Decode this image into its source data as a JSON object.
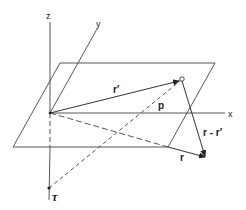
{
  "diagram": {
    "axes": {
      "z": "z",
      "y": "y",
      "x": "x"
    },
    "vectors": {
      "r_prime": "r′",
      "p": "p",
      "r": "r",
      "r_minus_r_prime": "r - r′"
    },
    "points": {
      "tau": "τ"
    },
    "colors": {
      "line": "#333333",
      "background": "#ffffff"
    }
  }
}
